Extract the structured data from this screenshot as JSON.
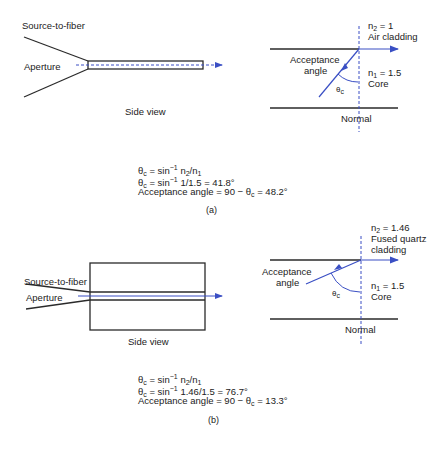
{
  "panel_a": {
    "side_view": {
      "source_label": "Source-to-fiber",
      "aperture_label": "Aperture",
      "caption": "Side view"
    },
    "interface": {
      "n2": "n",
      "n2_sub": "2",
      "n2_value": " = 1",
      "cladding": "Air cladding",
      "n1": "n",
      "n1_sub": "1",
      "n1_value": " = 1.5",
      "core": "Core",
      "acceptance_line1": "Acceptance",
      "acceptance_line2": "angle",
      "theta": "θ",
      "theta_sub": "c",
      "normal": "Normal"
    },
    "equations": {
      "eq1_lhs": "θ",
      "eq1_sub": "c",
      "eq1_mid": " = sin",
      "eq1_sup": "−1",
      "eq1_rhs_a": " n",
      "eq1_rhs_sub_a": "2",
      "eq1_rhs_b": "/n",
      "eq1_rhs_sub_b": "1",
      "eq2_lhs": "θ",
      "eq2_sub": "c",
      "eq2_mid": " = sin",
      "eq2_sup": "−1",
      "eq2_rhs": " 1/1.5 = 41.8°",
      "eq3_a": "Acceptance angle = 90 − θ",
      "eq3_sub": "c",
      "eq3_b": " = 48.2°"
    },
    "label": "(a)"
  },
  "panel_b": {
    "side_view": {
      "source_label": "Source-to-fiber",
      "aperture_label": "Aperture",
      "caption": "Side view"
    },
    "interface": {
      "n2": "n",
      "n2_sub": "2",
      "n2_value": " = 1.46",
      "cladding_line1": "Fused quartz",
      "cladding_line2": "cladding",
      "n1": "n",
      "n1_sub": "1",
      "n1_value": " = 1.5",
      "core": "Core",
      "acceptance_line1": "Acceptance",
      "acceptance_line2": "angle",
      "theta": "θ",
      "theta_sub": "c",
      "normal": "Normal"
    },
    "equations": {
      "eq1_lhs": "θ",
      "eq1_sub": "c",
      "eq1_mid": " = sin",
      "eq1_sup": "−1",
      "eq1_rhs_a": " n",
      "eq1_rhs_sub_a": "2",
      "eq1_rhs_b": "/n",
      "eq1_rhs_sub_b": "1",
      "eq2_lhs": "θ",
      "eq2_sub": "c",
      "eq2_mid": " = sin",
      "eq2_sup": "−1",
      "eq2_rhs": " 1.46/1.5 = 76.7°",
      "eq3_a": "Acceptance angle = 90 − θ",
      "eq3_sub": "c",
      "eq3_b": " = 13.3°"
    },
    "label": "(b)"
  },
  "colors": {
    "line": "#2a2a2a",
    "ray": "#3a4fc4"
  }
}
